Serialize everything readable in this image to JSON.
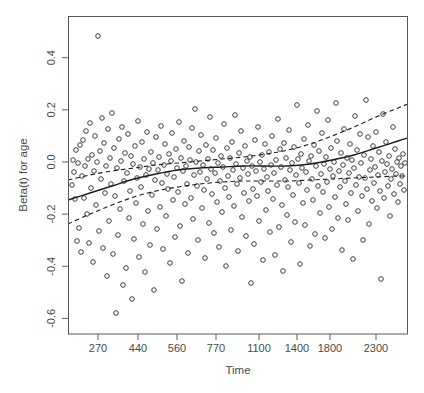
{
  "chart_data": {
    "type": "scatter",
    "title": "",
    "xlabel": "Time",
    "ylabel": "Beta(t) for age",
    "grid": false,
    "legend": null,
    "x_scale": "nonlinear-quantile",
    "xtick_labels": [
      "270",
      "440",
      "560",
      "770",
      "1100",
      "1400",
      "1800",
      "2300"
    ],
    "xtick_positions_px": [
      98,
      138,
      177,
      216,
      259,
      297,
      330,
      376
    ],
    "ytick_labels": [
      "0.4",
      "0.2",
      "0.0",
      "-0.2",
      "-0.4",
      "-0.6"
    ],
    "ytick_values": [
      0.4,
      0.2,
      0.0,
      -0.2,
      -0.4,
      -0.6
    ],
    "ylim": [
      -0.66,
      0.56
    ],
    "xlim_px": [
      68,
      408
    ],
    "ylim_px": [
      16,
      334
    ],
    "point_marker": "open-circle",
    "point_radius_px": 2.3,
    "n_points": 268,
    "points": [
      [
        72,
        185
      ],
      [
        73,
        160
      ],
      [
        74,
        172
      ],
      [
        75,
        199
      ],
      [
        76,
        150
      ],
      [
        77,
        241
      ],
      [
        78,
        163
      ],
      [
        79,
        228
      ],
      [
        80,
        145
      ],
      [
        81,
        252
      ],
      [
        82,
        176
      ],
      [
        83,
        140
      ],
      [
        84,
        198
      ],
      [
        85,
        166
      ],
      [
        86,
        131
      ],
      [
        87,
        214
      ],
      [
        88,
        159
      ],
      [
        89,
        243
      ],
      [
        90,
        123
      ],
      [
        91,
        188
      ],
      [
        92,
        155
      ],
      [
        93,
        262
      ],
      [
        94,
        171
      ],
      [
        95,
        136
      ],
      [
        96,
        205
      ],
      [
        97,
        162
      ],
      [
        98,
        36
      ],
      [
        99,
        231
      ],
      [
        100,
        151
      ],
      [
        101,
        179
      ],
      [
        102,
        118
      ],
      [
        103,
        248
      ],
      [
        104,
        143
      ],
      [
        105,
        193
      ],
      [
        106,
        166
      ],
      [
        107,
        276
      ],
      [
        108,
        129
      ],
      [
        109,
        221
      ],
      [
        110,
        158
      ],
      [
        111,
        184
      ],
      [
        112,
        113
      ],
      [
        113,
        254
      ],
      [
        114,
        148
      ],
      [
        115,
        196
      ],
      [
        116,
        313
      ],
      [
        117,
        168
      ],
      [
        118,
        235
      ],
      [
        119,
        139
      ],
      [
        120,
        209
      ],
      [
        121,
        161
      ],
      [
        122,
        127
      ],
      [
        123,
        285
      ],
      [
        124,
        181
      ],
      [
        125,
        153
      ],
      [
        126,
        268
      ],
      [
        127,
        173
      ],
      [
        128,
        134
      ],
      [
        129,
        218
      ],
      [
        130,
        191
      ],
      [
        131,
        156
      ],
      [
        132,
        299
      ],
      [
        133,
        164
      ],
      [
        134,
        239
      ],
      [
        135,
        146
      ],
      [
        136,
        203
      ],
      [
        137,
        178
      ],
      [
        138,
        121
      ],
      [
        139,
        257
      ],
      [
        140,
        167
      ],
      [
        141,
        187
      ],
      [
        142,
        142
      ],
      [
        143,
        224
      ],
      [
        144,
        159
      ],
      [
        145,
        272
      ],
      [
        146,
        175
      ],
      [
        147,
        132
      ],
      [
        148,
        211
      ],
      [
        149,
        169
      ],
      [
        150,
        245
      ],
      [
        151,
        152
      ],
      [
        152,
        195
      ],
      [
        153,
        163
      ],
      [
        154,
        290
      ],
      [
        155,
        180
      ],
      [
        156,
        137
      ],
      [
        157,
        229
      ],
      [
        158,
        170
      ],
      [
        159,
        157
      ],
      [
        160,
        207
      ],
      [
        161,
        126
      ],
      [
        162,
        183
      ],
      [
        163,
        249
      ],
      [
        164,
        165
      ],
      [
        165,
        144
      ],
      [
        166,
        216
      ],
      [
        167,
        174
      ],
      [
        168,
        189
      ],
      [
        169,
        154
      ],
      [
        170,
        263
      ],
      [
        171,
        161
      ],
      [
        172,
        133
      ],
      [
        173,
        200
      ],
      [
        174,
        177
      ],
      [
        175,
        237
      ],
      [
        176,
        149
      ],
      [
        177,
        168
      ],
      [
        178,
        192
      ],
      [
        179,
        122
      ],
      [
        180,
        226
      ],
      [
        181,
        158
      ],
      [
        182,
        281
      ],
      [
        183,
        171
      ],
      [
        184,
        141
      ],
      [
        185,
        204
      ],
      [
        186,
        166
      ],
      [
        187,
        184
      ],
      [
        188,
        253
      ],
      [
        189,
        147
      ],
      [
        190,
        160
      ],
      [
        191,
        198
      ],
      [
        192,
        128
      ],
      [
        193,
        219
      ],
      [
        194,
        175
      ],
      [
        195,
        109
      ],
      [
        196,
        162
      ],
      [
        197,
        186
      ],
      [
        198,
        240
      ],
      [
        199,
        151
      ],
      [
        200,
        172
      ],
      [
        201,
        135
      ],
      [
        202,
        208
      ],
      [
        203,
        165
      ],
      [
        204,
        190
      ],
      [
        205,
        258
      ],
      [
        206,
        145
      ],
      [
        207,
        179
      ],
      [
        208,
        159
      ],
      [
        209,
        223
      ],
      [
        210,
        117
      ],
      [
        211,
        169
      ],
      [
        212,
        194
      ],
      [
        213,
        150
      ],
      [
        214,
        233
      ],
      [
        215,
        173
      ],
      [
        216,
        138
      ],
      [
        217,
        202
      ],
      [
        218,
        163
      ],
      [
        219,
        247
      ],
      [
        220,
        181
      ],
      [
        221,
        156
      ],
      [
        222,
        212
      ],
      [
        223,
        167
      ],
      [
        224,
        124
      ],
      [
        225,
        188
      ],
      [
        226,
        266
      ],
      [
        227,
        148
      ],
      [
        228,
        176
      ],
      [
        229,
        197
      ],
      [
        230,
        158
      ],
      [
        231,
        230
      ],
      [
        232,
        142
      ],
      [
        233,
        170
      ],
      [
        234,
        206
      ],
      [
        235,
        115
      ],
      [
        236,
        164
      ],
      [
        237,
        184
      ],
      [
        238,
        251
      ],
      [
        239,
        153
      ],
      [
        240,
        178
      ],
      [
        241,
        131
      ],
      [
        242,
        217
      ],
      [
        243,
        168
      ],
      [
        244,
        193
      ],
      [
        245,
        146
      ],
      [
        246,
        236
      ],
      [
        247,
        161
      ],
      [
        248,
        174
      ],
      [
        249,
        201
      ],
      [
        250,
        157
      ],
      [
        251,
        283
      ],
      [
        252,
        166
      ],
      [
        253,
        189
      ],
      [
        254,
        244
      ],
      [
        255,
        140
      ],
      [
        256,
        171
      ],
      [
        257,
        196
      ],
      [
        258,
        127
      ],
      [
        259,
        221
      ],
      [
        260,
        162
      ],
      [
        261,
        182
      ],
      [
        262,
        155
      ],
      [
        263,
        260
      ],
      [
        264,
        169
      ],
      [
        265,
        144
      ],
      [
        266,
        210
      ],
      [
        267,
        177
      ],
      [
        268,
        191
      ],
      [
        269,
        152
      ],
      [
        270,
        232
      ],
      [
        271,
        165
      ],
      [
        272,
        136
      ],
      [
        273,
        199
      ],
      [
        274,
        173
      ],
      [
        275,
        255
      ],
      [
        276,
        160
      ],
      [
        277,
        185
      ],
      [
        278,
        119
      ],
      [
        279,
        227
      ],
      [
        280,
        149
      ],
      [
        281,
        167
      ],
      [
        282,
        205
      ],
      [
        283,
        271
      ],
      [
        284,
        143
      ],
      [
        285,
        180
      ],
      [
        286,
        158
      ],
      [
        287,
        215
      ],
      [
        288,
        187
      ],
      [
        289,
        130
      ],
      [
        290,
        170
      ],
      [
        291,
        242
      ],
      [
        292,
        163
      ],
      [
        293,
        195
      ],
      [
        294,
        147
      ],
      [
        295,
        222
      ],
      [
        296,
        175
      ],
      [
        297,
        105
      ],
      [
        298,
        159
      ],
      [
        299,
        183
      ],
      [
        300,
        264
      ],
      [
        301,
        154
      ],
      [
        302,
        168
      ],
      [
        303,
        203
      ],
      [
        304,
        139
      ],
      [
        305,
        225
      ],
      [
        306,
        172
      ],
      [
        307,
        190
      ],
      [
        308,
        125
      ],
      [
        309,
        161
      ],
      [
        310,
        246
      ],
      [
        311,
        156
      ],
      [
        312,
        179
      ],
      [
        313,
        200
      ],
      [
        314,
        145
      ],
      [
        315,
        234
      ],
      [
        316,
        166
      ],
      [
        317,
        111
      ],
      [
        318,
        186
      ],
      [
        319,
        151
      ],
      [
        320,
        213
      ],
      [
        321,
        174
      ],
      [
        322,
        133
      ],
      [
        323,
        192
      ],
      [
        324,
        164
      ],
      [
        325,
        238
      ],
      [
        326,
        157
      ],
      [
        327,
        182
      ],
      [
        328,
        120
      ],
      [
        329,
        207
      ],
      [
        330,
        169
      ],
      [
        331,
        148
      ],
      [
        332,
        229
      ],
      [
        333,
        176
      ],
      [
        334,
        162
      ],
      [
        335,
        197
      ],
      [
        336,
        103
      ],
      [
        337,
        141
      ],
      [
        338,
        218
      ],
      [
        339,
        171
      ],
      [
        340,
        187
      ],
      [
        341,
        153
      ],
      [
        342,
        250
      ],
      [
        343,
        165
      ],
      [
        344,
        129
      ],
      [
        345,
        181
      ],
      [
        346,
        204
      ],
      [
        347,
        158
      ],
      [
        348,
        220
      ],
      [
        349,
        173
      ],
      [
        350,
        144
      ],
      [
        351,
        193
      ],
      [
        352,
        160
      ],
      [
        353,
        259
      ],
      [
        354,
        168
      ],
      [
        355,
        116
      ],
      [
        356,
        185
      ],
      [
        357,
        150
      ],
      [
        358,
        211
      ],
      [
        359,
        177
      ],
      [
        360,
        134
      ],
      [
        361,
        163
      ],
      [
        362,
        196
      ],
      [
        363,
        240
      ],
      [
        364,
        155
      ],
      [
        365,
        178
      ],
      [
        366,
        100
      ],
      [
        367,
        189
      ],
      [
        368,
        137
      ],
      [
        369,
        224
      ],
      [
        370,
        170
      ],
      [
        371,
        159
      ],
      [
        372,
        201
      ],
      [
        373,
        146
      ],
      [
        374,
        183
      ],
      [
        375,
        167
      ],
      [
        376,
        132
      ],
      [
        377,
        208
      ],
      [
        378,
        175
      ],
      [
        379,
        152
      ],
      [
        380,
        191
      ],
      [
        381,
        279
      ],
      [
        382,
        161
      ],
      [
        383,
        114
      ],
      [
        384,
        198
      ],
      [
        385,
        172
      ],
      [
        386,
        142
      ],
      [
        387,
        164
      ],
      [
        388,
        186
      ],
      [
        389,
        156
      ],
      [
        390,
        216
      ],
      [
        391,
        179
      ],
      [
        392,
        169
      ],
      [
        393,
        127
      ],
      [
        394,
        194
      ],
      [
        395,
        149
      ],
      [
        396,
        174
      ],
      [
        397,
        162
      ],
      [
        398,
        202
      ],
      [
        399,
        158
      ],
      [
        400,
        184
      ],
      [
        401,
        166
      ],
      [
        402,
        176
      ],
      [
        403,
        154
      ],
      [
        404,
        190
      ],
      [
        405,
        163
      ]
    ],
    "fit_line": {
      "style": "solid",
      "label": "smoothed beta(t) estimate",
      "path_px": [
        [
          68,
          200
        ],
        [
          90,
          193
        ],
        [
          112,
          186
        ],
        [
          134,
          179
        ],
        [
          156,
          174
        ],
        [
          178,
          170
        ],
        [
          200,
          168
        ],
        [
          222,
          167
        ],
        [
          244,
          166
        ],
        [
          266,
          166
        ],
        [
          288,
          166
        ],
        [
          310,
          164
        ],
        [
          332,
          160
        ],
        [
          354,
          155
        ],
        [
          376,
          148
        ],
        [
          398,
          141
        ],
        [
          408,
          138
        ]
      ]
    },
    "confidence_bands": [
      {
        "name": "upper-confidence-band",
        "style": "dashed",
        "path_px": [
          [
            68,
            180
          ],
          [
            90,
            175
          ],
          [
            112,
            171
          ],
          [
            134,
            168
          ],
          [
            156,
            165
          ],
          [
            178,
            163
          ],
          [
            200,
            161
          ],
          [
            222,
            159
          ],
          [
            244,
            157
          ],
          [
            266,
            154
          ],
          [
            288,
            150
          ],
          [
            310,
            144
          ],
          [
            332,
            136
          ],
          [
            354,
            127
          ],
          [
            376,
            117
          ],
          [
            398,
            108
          ],
          [
            408,
            104
          ]
        ]
      },
      {
        "name": "lower-confidence-band",
        "style": "dashed",
        "path_px": [
          [
            68,
            224
          ],
          [
            90,
            214
          ],
          [
            112,
            205
          ],
          [
            134,
            197
          ],
          [
            156,
            191
          ],
          [
            178,
            187
          ],
          [
            200,
            184
          ],
          [
            222,
            182
          ],
          [
            244,
            181
          ],
          [
            266,
            181
          ],
          [
            288,
            181
          ],
          [
            310,
            180
          ],
          [
            332,
            179
          ],
          [
            354,
            178
          ],
          [
            376,
            177
          ],
          [
            398,
            176
          ],
          [
            408,
            176
          ]
        ]
      }
    ]
  },
  "axes": {
    "x_title": "Time",
    "y_title": "Beta(t) for age"
  },
  "colors": {
    "point_stroke": "#2b2b2b",
    "line": "#1d1d1d",
    "frame": "#5a5a5a",
    "text": "#4a4a4a",
    "background": "#ffffff"
  }
}
